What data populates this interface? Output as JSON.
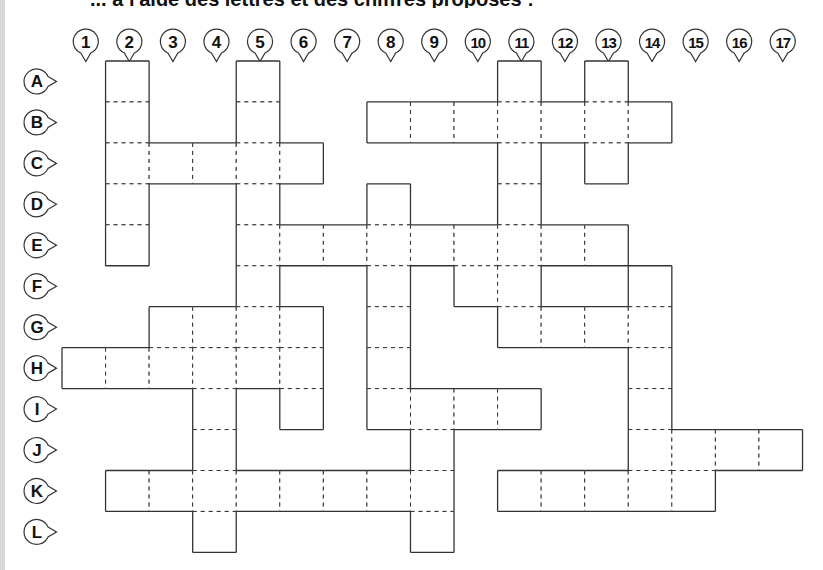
{
  "instruction": "... à l'aide des lettres et des chiffres proposés :",
  "columns": [
    "1",
    "2",
    "3",
    "4",
    "5",
    "6",
    "7",
    "8",
    "9",
    "10",
    "11",
    "12",
    "13",
    "14",
    "15",
    "16",
    "17"
  ],
  "rows": [
    "A",
    "B",
    "C",
    "D",
    "E",
    "F",
    "G",
    "H",
    "I",
    "J",
    "K",
    "L"
  ],
  "cells": {
    "A": [
      2,
      5,
      11,
      13
    ],
    "B": [
      2,
      5,
      8,
      9,
      10,
      11,
      12,
      13,
      14
    ],
    "C": [
      2,
      3,
      4,
      5,
      6,
      11,
      13
    ],
    "D": [
      2,
      5,
      8,
      11
    ],
    "E": [
      2,
      5,
      6,
      7,
      8,
      9,
      10,
      11,
      12,
      13
    ],
    "F": [
      5,
      8,
      10,
      11,
      14
    ],
    "G": [
      3,
      4,
      5,
      6,
      8,
      11,
      12,
      13,
      14
    ],
    "H": [
      1,
      2,
      3,
      4,
      5,
      6,
      8,
      14
    ],
    "I": [
      4,
      6,
      8,
      9,
      10,
      11,
      14
    ],
    "J": [
      4,
      9,
      14,
      15,
      16,
      17
    ],
    "K": [
      2,
      3,
      4,
      5,
      6,
      7,
      8,
      9,
      11,
      12,
      13,
      14,
      15
    ],
    "L": [
      4,
      9
    ]
  },
  "colors": {
    "line": "#333333",
    "text": "#111111"
  }
}
